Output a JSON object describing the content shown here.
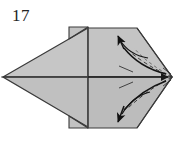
{
  "figure": {
    "step_number": "17",
    "caption": "",
    "type": "origami-fold-diagram",
    "background_color": "#ffffff"
  },
  "colors": {
    "paper_fill_light": "#c9c9c9",
    "paper_fill_mid": "#bdbdbd",
    "paper_fill_dark": "#b2b2b2",
    "paper_fill_flap": "#c4c4c4",
    "edge_stroke": "#3a3a3a",
    "fold_line": "#4a4a4a",
    "arrow_stroke": "#1a1a1a",
    "dash_stroke": "#2b2b2b",
    "number_color": "#232323"
  },
  "geometry": {
    "left_point": [
      3,
      77
    ],
    "right_point": [
      172,
      77
    ],
    "top_vertex": [
      88,
      28
    ],
    "bottom_vertex": [
      88,
      127
    ],
    "top_flap_rect": [
      69,
      27,
      19,
      12
    ],
    "bottom_flap_rect": [
      69,
      115,
      19,
      13
    ],
    "center_axis_y": 77,
    "center_axis_x": 88
  },
  "annotations": {
    "arrow_upper_right": {
      "name": "fold-arrow-up",
      "direction": "up-left",
      "description": "curved valley-fold arrow sweeping from right tip toward upper area"
    },
    "arrow_lower_right": {
      "name": "fold-arrow-down",
      "direction": "down-left",
      "description": "curved valley-fold arrow sweeping from right tip toward lower area"
    },
    "arrow_center": {
      "name": "center-axis-arrow",
      "direction": "right",
      "description": "horizontal axis arrow pointing to the right tip"
    }
  }
}
